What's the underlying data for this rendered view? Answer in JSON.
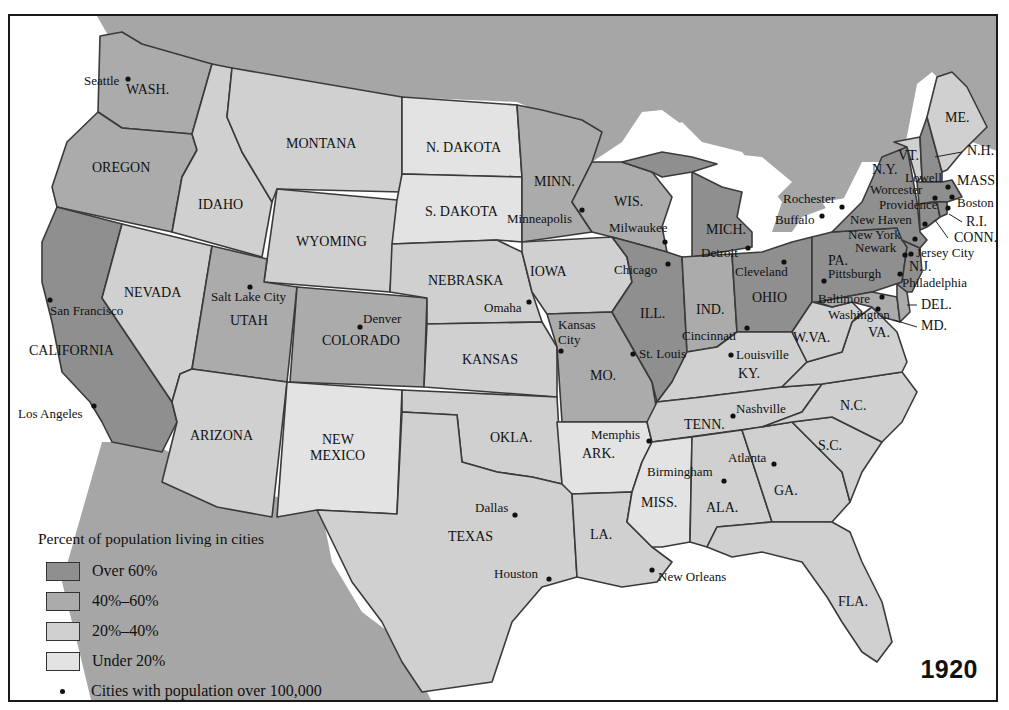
{
  "map": {
    "year": "1920",
    "legend": {
      "title": "Percent of population living in cities",
      "items": [
        {
          "label": "Over 60%",
          "color": "#8f8f8f"
        },
        {
          "label": "40%–60%",
          "color": "#ababab"
        },
        {
          "label": "20%–40%",
          "color": "#d0d0d0"
        },
        {
          "label": "Under 20%",
          "color": "#e3e3e3"
        }
      ],
      "cities_note": "Cities with population over 100,000"
    },
    "states": [
      {
        "label": "WASH.",
        "category": "40-60",
        "x": 124,
        "y": 92
      },
      {
        "label": "OREGON",
        "category": "40-60",
        "x": 90,
        "y": 170
      },
      {
        "label": "CALIFORNIA",
        "category": "over60",
        "x": 27,
        "y": 353
      },
      {
        "label": "IDAHO",
        "category": "20-40",
        "x": 196,
        "y": 207
      },
      {
        "label": "NEVADA",
        "category": "20-40",
        "x": 122,
        "y": 295
      },
      {
        "label": "MONTANA",
        "category": "20-40",
        "x": 284,
        "y": 146
      },
      {
        "label": "WYOMING",
        "category": "20-40",
        "x": 294,
        "y": 244
      },
      {
        "label": "UTAH",
        "category": "40-60",
        "x": 228,
        "y": 323
      },
      {
        "label": "COLORADO",
        "category": "40-60",
        "x": 320,
        "y": 343
      },
      {
        "label": "ARIZONA",
        "category": "20-40",
        "x": 188,
        "y": 438
      },
      {
        "label": "NEW",
        "category": "under20",
        "x": 320,
        "y": 442
      },
      {
        "label": "MEXICO",
        "category": "under20",
        "x": 308,
        "y": 458
      },
      {
        "label": "N. DAKOTA",
        "category": "under20",
        "x": 424,
        "y": 150
      },
      {
        "label": "S. DAKOTA",
        "category": "under20",
        "x": 423,
        "y": 214
      },
      {
        "label": "NEBRASKA",
        "category": "20-40",
        "x": 426,
        "y": 283
      },
      {
        "label": "KANSAS",
        "category": "20-40",
        "x": 460,
        "y": 362
      },
      {
        "label": "OKLA.",
        "category": "20-40",
        "x": 488,
        "y": 440
      },
      {
        "label": "TEXAS",
        "category": "20-40",
        "x": 446,
        "y": 539
      },
      {
        "label": "MINN.",
        "category": "40-60",
        "x": 532,
        "y": 184
      },
      {
        "label": "IOWA",
        "category": "20-40",
        "x": 528,
        "y": 274
      },
      {
        "label": "MO.",
        "category": "40-60",
        "x": 588,
        "y": 378
      },
      {
        "label": "ARK.",
        "category": "under20",
        "x": 580,
        "y": 456
      },
      {
        "label": "LA.",
        "category": "20-40",
        "x": 588,
        "y": 537
      },
      {
        "label": "WIS.",
        "category": "40-60",
        "x": 612,
        "y": 204
      },
      {
        "label": "ILL.",
        "category": "over60",
        "x": 638,
        "y": 316
      },
      {
        "label": "MICH.",
        "category": "over60",
        "x": 704,
        "y": 232
      },
      {
        "label": "IND.",
        "category": "40-60",
        "x": 694,
        "y": 312
      },
      {
        "label": "OHIO",
        "category": "over60",
        "x": 750,
        "y": 300
      },
      {
        "label": "KY.",
        "category": "20-40",
        "x": 736,
        "y": 376
      },
      {
        "label": "TENN.",
        "category": "20-40",
        "x": 682,
        "y": 427
      },
      {
        "label": "MISS.",
        "category": "under20",
        "x": 639,
        "y": 505
      },
      {
        "label": "ALA.",
        "category": "20-40",
        "x": 704,
        "y": 510
      },
      {
        "label": "GA.",
        "category": "20-40",
        "x": 772,
        "y": 493
      },
      {
        "label": "FLA.",
        "category": "20-40",
        "x": 836,
        "y": 604
      },
      {
        "label": "S.C.",
        "category": "20-40",
        "x": 816,
        "y": 448
      },
      {
        "label": "N.C.",
        "category": "20-40",
        "x": 838,
        "y": 408
      },
      {
        "label": "VA.",
        "category": "20-40",
        "x": 866,
        "y": 335
      },
      {
        "label": "W.VA.",
        "category": "20-40",
        "x": 791,
        "y": 340
      },
      {
        "label": "PA.",
        "category": "over60",
        "x": 826,
        "y": 263
      },
      {
        "label": "N.Y.",
        "category": "over60",
        "x": 870,
        "y": 172
      },
      {
        "label": "N.J.",
        "category": "over60",
        "x": 907,
        "y": 269
      },
      {
        "label": "VT.",
        "category": "20-40",
        "x": 896,
        "y": 158
      },
      {
        "label": "ME.",
        "category": "20-40",
        "x": 943,
        "y": 120
      },
      {
        "label": "N.H.",
        "category": "over60",
        "x": 965,
        "y": 153
      },
      {
        "label": "MASS.",
        "category": "over60",
        "x": 955,
        "y": 183
      },
      {
        "label": "R.I.",
        "category": "over60",
        "x": 964,
        "y": 224
      },
      {
        "label": "CONN.",
        "category": "over60",
        "x": 952,
        "y": 240
      },
      {
        "label": "DEL.",
        "category": "40-60",
        "x": 919,
        "y": 307
      },
      {
        "label": "MD.",
        "category": "40-60",
        "x": 919,
        "y": 328
      }
    ],
    "cities": [
      {
        "name": "Seattle",
        "dot": [
          126,
          77
        ],
        "x": 82,
        "y": 83
      },
      {
        "name": "San Francisco",
        "dot": [
          48,
          298
        ],
        "x": 48,
        "y": 313
      },
      {
        "name": "Los Angeles",
        "dot": [
          92,
          404
        ],
        "x": 16,
        "y": 416
      },
      {
        "name": "Salt Lake City",
        "dot": [
          248,
          285
        ],
        "x": 209,
        "y": 299
      },
      {
        "name": "Denver",
        "dot": [
          358,
          325
        ],
        "x": 361,
        "y": 321
      },
      {
        "name": "Omaha",
        "dot": [
          527,
          300
        ],
        "x": 482,
        "y": 310
      },
      {
        "name": "Kansas",
        "dot": [
          559,
          349
        ],
        "x": 556,
        "y": 327
      },
      {
        "name": "City",
        "dot": null,
        "x": 556,
        "y": 342
      },
      {
        "name": "Minneapolis",
        "dot": [
          580,
          208
        ],
        "x": 505,
        "y": 221
      },
      {
        "name": "Milwaukee",
        "dot": [
          663,
          240
        ],
        "x": 607,
        "y": 230
      },
      {
        "name": "Chicago",
        "dot": [
          666,
          262
        ],
        "x": 612,
        "y": 272
      },
      {
        "name": "St. Louis",
        "dot": [
          631,
          352
        ],
        "x": 637,
        "y": 356
      },
      {
        "name": "Detroit",
        "dot": [
          746,
          246
        ],
        "x": 699,
        "y": 255
      },
      {
        "name": "Cleveland",
        "dot": [
          782,
          260
        ],
        "x": 733,
        "y": 274
      },
      {
        "name": "Cincinnati",
        "dot": [
          745,
          326
        ],
        "x": 680,
        "y": 338
      },
      {
        "name": "Louisville",
        "dot": [
          729,
          353
        ],
        "x": 734,
        "y": 357
      },
      {
        "name": "Memphis",
        "dot": [
          647,
          439
        ],
        "x": 589,
        "y": 437
      },
      {
        "name": "Nashville",
        "dot": [
          731,
          414
        ],
        "x": 734,
        "y": 411
      },
      {
        "name": "Birmingham",
        "dot": [
          722,
          479
        ],
        "x": 645,
        "y": 474
      },
      {
        "name": "Atlanta",
        "dot": [
          772,
          462
        ],
        "x": 726,
        "y": 460
      },
      {
        "name": "New Orleans",
        "dot": [
          650,
          568
        ],
        "x": 656,
        "y": 579
      },
      {
        "name": "Dallas",
        "dot": [
          513,
          513
        ],
        "x": 473,
        "y": 510
      },
      {
        "name": "Houston",
        "dot": [
          547,
          577
        ],
        "x": 492,
        "y": 576
      },
      {
        "name": "Rochester",
        "dot": [
          840,
          205
        ],
        "x": 781,
        "y": 201
      },
      {
        "name": "Buffalo",
        "dot": [
          820,
          214
        ],
        "x": 773,
        "y": 222
      },
      {
        "name": "Pittsburgh",
        "dot": [
          822,
          279
        ],
        "x": 826,
        "y": 276
      },
      {
        "name": "Washington",
        "dot": [
          876,
          307
        ],
        "x": 826,
        "y": 317
      },
      {
        "name": "Baltimore",
        "dot": [
          880,
          295
        ],
        "x": 816,
        "y": 301
      },
      {
        "name": "Philadelphia",
        "dot": [
          898,
          272
        ],
        "x": 900,
        "y": 285
      },
      {
        "name": "Newark",
        "dot": [
          903,
          253
        ],
        "x": 853,
        "y": 250
      },
      {
        "name": "Jersey City",
        "dot": [
          909,
          252
        ],
        "x": 914,
        "y": 255
      },
      {
        "name": "New York",
        "dot": [
          913,
          237
        ],
        "x": 846,
        "y": 237
      },
      {
        "name": "New Haven",
        "dot": [
          923,
          222
        ],
        "x": 848,
        "y": 222
      },
      {
        "name": "Providence",
        "dot": [
          946,
          206
        ],
        "x": 877,
        "y": 207
      },
      {
        "name": "Worcester",
        "dot": [
          933,
          196
        ],
        "x": 868,
        "y": 192
      },
      {
        "name": "Lowell",
        "dot": [
          946,
          185
        ],
        "x": 903,
        "y": 180
      },
      {
        "name": "Boston",
        "dot": [
          950,
          195
        ],
        "x": 955,
        "y": 205
      }
    ]
  }
}
